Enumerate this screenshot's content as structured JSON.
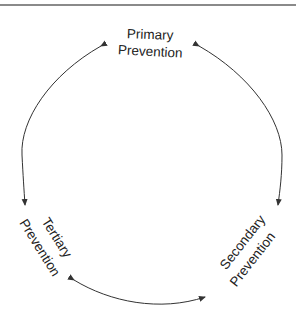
{
  "diagram": {
    "type": "cycle",
    "nodes": [
      {
        "id": "primary",
        "line1": "Primary",
        "line2": "Prevention"
      },
      {
        "id": "secondary",
        "line1": "Secondary",
        "line2": "Prevention"
      },
      {
        "id": "tertiary",
        "line1": "Tertiary",
        "line2": "Prevention"
      }
    ],
    "edges": [
      {
        "from": "primary",
        "to": "tertiary",
        "bidirectional": true
      },
      {
        "from": "primary",
        "to": "secondary",
        "bidirectional": true
      },
      {
        "from": "tertiary",
        "to": "secondary",
        "bidirectional": true
      }
    ],
    "colors": {
      "stroke": "#333333",
      "text": "#222222",
      "border": "#8a8a8a"
    }
  }
}
